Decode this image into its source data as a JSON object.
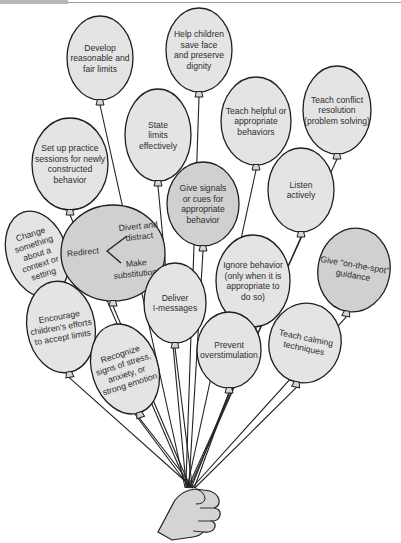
{
  "figure": {
    "type": "balloon-bouquet-diagram",
    "colors": {
      "balloon_light": "#e4e4e4",
      "balloon_dark": "#d0d0d0",
      "outline": "#1f1f1f",
      "text": "#2e2e2e",
      "hand": "#d4d4d4"
    },
    "hand": {
      "x": 190,
      "y": 488
    },
    "balloons": [
      {
        "id": "develop-limits",
        "lines": [
          "Develop",
          "reasonable and",
          "fair limits"
        ],
        "cx": 100,
        "cy": 58,
        "rx": 33,
        "ry": 42,
        "rot": 0,
        "shade": "light"
      },
      {
        "id": "save-face",
        "lines": [
          "Help children",
          "save face",
          "and preserve",
          "dignity"
        ],
        "cx": 199,
        "cy": 50,
        "rx": 33,
        "ry": 42,
        "rot": 0,
        "shade": "light"
      },
      {
        "id": "state-limits",
        "lines": [
          "State",
          "limits",
          "effectively"
        ],
        "cx": 158,
        "cy": 135,
        "rx": 33,
        "ry": 46,
        "rot": 0,
        "shade": "light"
      },
      {
        "id": "teach-helpful",
        "lines": [
          "Teach helpful or",
          "appropriate",
          "behaviors"
        ],
        "cx": 256,
        "cy": 121,
        "rx": 35,
        "ry": 44,
        "rot": 0,
        "shade": "light"
      },
      {
        "id": "conflict-resolution",
        "lines": [
          "Teach conflict",
          "resolution",
          "(problem solving)"
        ],
        "cx": 337,
        "cy": 110,
        "rx": 34,
        "ry": 44,
        "rot": 0,
        "shade": "light"
      },
      {
        "id": "practice-sessions",
        "lines": [
          "Set up practice",
          "sessions for newly",
          "constructed",
          "behavior"
        ],
        "cx": 70,
        "cy": 164,
        "rx": 38,
        "ry": 46,
        "rot": 0,
        "shade": "light"
      },
      {
        "id": "signals-cues",
        "lines": [
          "Give signals",
          "or cues for",
          "appropriate",
          "behavior"
        ],
        "cx": 203,
        "cy": 204,
        "rx": 36,
        "ry": 42,
        "rot": 0,
        "shade": "dark"
      },
      {
        "id": "listen-actively",
        "lines": [
          "Listen",
          "actively"
        ],
        "cx": 301,
        "cy": 190,
        "rx": 33,
        "ry": 42,
        "rot": 0,
        "shade": "light"
      },
      {
        "id": "change-context",
        "lines": [
          "Change",
          "something",
          "about a",
          "context or",
          "setting"
        ],
        "cx": 37,
        "cy": 254,
        "rx": 30,
        "ry": 44,
        "rot": -18,
        "shade": "light"
      },
      {
        "id": "redirect",
        "lines": [],
        "cx": 113,
        "cy": 253,
        "rx": 52,
        "ry": 48,
        "rot": 0,
        "shade": "dark"
      },
      {
        "id": "ignore-behavior",
        "lines": [
          "Ignore behavior",
          "(only when it is",
          "appropriate to",
          "do so)"
        ],
        "cx": 253,
        "cy": 281,
        "rx": 37,
        "ry": 46,
        "rot": 0,
        "shade": "light"
      },
      {
        "id": "on-the-spot",
        "lines": [
          "Give \"on-the-spot\"",
          "guidance"
        ],
        "cx": 354,
        "cy": 270,
        "rx": 36,
        "ry": 42,
        "rot": 10,
        "shade": "dark"
      },
      {
        "id": "i-messages",
        "lines": [
          "Deliver",
          "I-messages"
        ],
        "cx": 175,
        "cy": 303,
        "rx": 31,
        "ry": 40,
        "rot": 0,
        "shade": "light"
      },
      {
        "id": "encourage-efforts",
        "lines": [
          "Encourage",
          "children's efforts",
          "to accept limits"
        ],
        "cx": 61,
        "cy": 327,
        "rx": 34,
        "ry": 46,
        "rot": -10,
        "shade": "light"
      },
      {
        "id": "recognize-stress",
        "lines": [
          "Recognize",
          "signs of stress,",
          "anxiety, or",
          "strong emotion"
        ],
        "cx": 125,
        "cy": 369,
        "rx": 33,
        "ry": 46,
        "rot": -18,
        "shade": "light"
      },
      {
        "id": "prevent-overstimulation",
        "lines": [
          "Prevent",
          "overstimulation"
        ],
        "cx": 229,
        "cy": 350,
        "rx": 32,
        "ry": 38,
        "rot": 0,
        "shade": "light"
      },
      {
        "id": "teach-calming",
        "lines": [
          "Teach calming",
          "techniques"
        ],
        "cx": 305,
        "cy": 343,
        "rx": 36,
        "ry": 40,
        "rot": 12,
        "shade": "light"
      }
    ],
    "redirect_block": {
      "main_label": "Redirect",
      "branch_top": [
        "Divert and",
        "distract"
      ],
      "branch_bottom": [
        "Make",
        "substitutions"
      ]
    }
  }
}
